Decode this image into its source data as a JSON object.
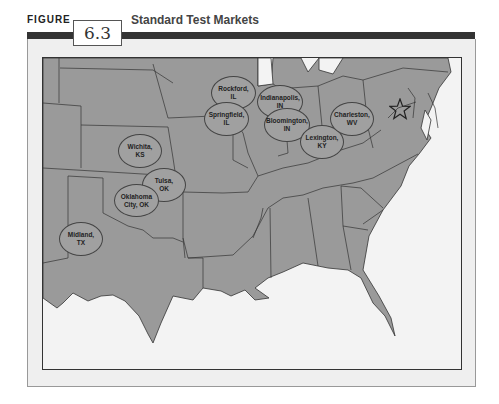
{
  "figure": {
    "label": "FIGURE",
    "number": "6.3",
    "title": "Standard Test Markets"
  },
  "map": {
    "land_color": "#9a9a9a",
    "water_color": "#f3f3f3",
    "marker": "star-icon",
    "cities": [
      {
        "label": "Rockford,\nIL"
      },
      {
        "label": "Springfield,\nIL"
      },
      {
        "label": "Indianapolis,\nIN"
      },
      {
        "label": "Bloomington,\nIN"
      },
      {
        "label": "Lexington,\nKY"
      },
      {
        "label": "Charleston,\nWV"
      },
      {
        "label": "Wichita,\nKS"
      },
      {
        "label": "Tulsa,\nOK"
      },
      {
        "label": "Oklahoma\nCity, OK"
      },
      {
        "label": "Midland,\nTX"
      }
    ]
  }
}
